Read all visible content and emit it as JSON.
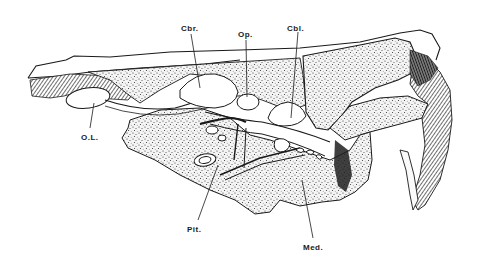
{
  "figure": {
    "ink_color": "#1a1a1a",
    "paper_color": "#ffffff",
    "stipple_fill": "#f2f2f2"
  },
  "labels": [
    {
      "id": "cbr",
      "text": "Cbr.",
      "x": 181,
      "y": 24
    },
    {
      "id": "op",
      "text": "Op.",
      "x": 238,
      "y": 30
    },
    {
      "id": "cbl",
      "text": "Cbl.",
      "x": 287,
      "y": 24
    },
    {
      "id": "ol",
      "text": "O.L.",
      "x": 81,
      "y": 133
    },
    {
      "id": "pit",
      "text": "Pit.",
      "x": 187,
      "y": 225
    },
    {
      "id": "med",
      "text": "Med.",
      "x": 303,
      "y": 243
    }
  ]
}
